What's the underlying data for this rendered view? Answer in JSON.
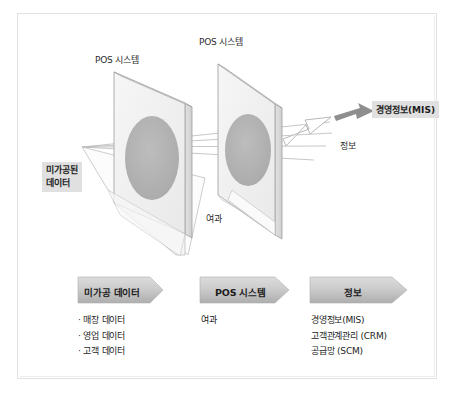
{
  "diagram": {
    "scene": {
      "panel1_label": "POS 시스템",
      "panel2_label": "POS 시스템",
      "raw_data_chip": [
        "미가공된",
        "데이터"
      ],
      "filter_label": "여과",
      "information_label": "정보",
      "mis_chip": "경영정보(MIS)"
    },
    "flow": {
      "steps": [
        {
          "label": "미가공 데이터",
          "items": [
            "· 매장 데이터",
            "· 영업 데이터",
            "· 고객 데이터"
          ]
        },
        {
          "label": "POS 시스템",
          "items": [
            "여과"
          ]
        },
        {
          "label": "정보",
          "items": [
            "경영정보(MIS)",
            "고객관계관리 (CRM)",
            "공급망 (SCM)"
          ]
        }
      ]
    },
    "colors": {
      "panel_face": "#f0f0f0",
      "panel_edge": "#9a9a9a",
      "ellipse": "#b2b2b2",
      "chip_bg": "#e0e0e0",
      "chevron_fill": "#c9c9c9",
      "arrow_gray": "#8c8c8c",
      "frame_border": "#e2e2e2",
      "text": "#232323"
    }
  }
}
